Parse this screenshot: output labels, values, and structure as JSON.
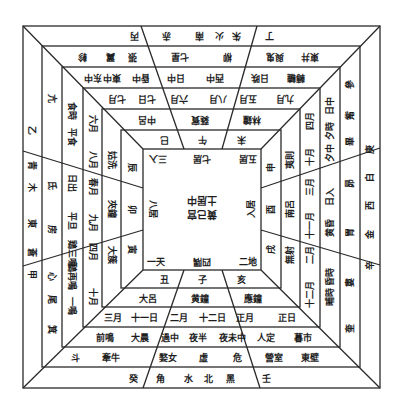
{
  "diagram": {
    "title": "",
    "center": {
      "line1": "土居中",
      "line2": "黄己宫"
    },
    "inner_corners": {
      "top_left": "三入",
      "top_mid": "七居",
      "top_right": "五居",
      "left_mid": "八居",
      "right_mid": "入居",
      "bottom_left": "一天",
      "bottom_mid": "四隅",
      "bottom_right": "二地"
    },
    "ring1": {
      "top": [
        "巳",
        "午",
        "未"
      ],
      "bottom": [
        "丑",
        "子",
        "亥"
      ],
      "left": [
        "辰",
        "卯",
        "寅"
      ],
      "right": [
        "申",
        "酉",
        "戌"
      ]
    },
    "ring2": {
      "top": [
        "中呂",
        "蕤賓",
        "林鐘"
      ],
      "bottom": [
        "大呂",
        "黄鐘",
        "應鐘"
      ],
      "left": [
        "姑洗",
        "夾鐘",
        "大簇"
      ],
      "right": [
        "夷則",
        "南呂",
        "無射"
      ]
    },
    "ring3": {
      "top": [
        "七月",
        "七日",
        "六月",
        "八月",
        "五月",
        "九月"
      ],
      "bottom": [
        "三月",
        "十一日",
        "二月",
        "十二日",
        "正月",
        "正日"
      ],
      "left": [
        "六月",
        "八月",
        "春月",
        "九月",
        "四月",
        "十月"
      ],
      "right": [
        "四月",
        "十月",
        "三月",
        "十一月",
        "二月",
        "十二月"
      ]
    },
    "ring4": {
      "top": [
        "东中",
        "東中",
        "昏中",
        "日中",
        "西中",
        "日昳",
        "轉轆"
      ],
      "bottom": [
        "前鳴",
        "大晨",
        "過中",
        "夜半",
        "夜未中",
        "人定",
        "暮市"
      ],
      "left": [
        "食時",
        "平食",
        "日出",
        "平旦",
        "鶏三鳴",
        "鶏再鳴",
        "一鳴"
      ],
      "right": [
        "日中",
        "夕時",
        "夕中",
        "日入",
        "黄昏",
        "昏時",
        "晡時"
      ]
    },
    "ring5": {
      "top": [
        "軫",
        "翼",
        "張",
        "七星",
        "柳",
        "與鬼",
        "東井"
      ],
      "bottom": [
        "斗",
        "牽牛",
        "婺女",
        "虛",
        "危",
        "營室",
        "東壁"
      ],
      "left": [
        "亢",
        "氐",
        "房",
        "心",
        "尾",
        "箕"
      ],
      "right": [
        "參",
        "觜",
        "畢",
        "昴",
        "胃",
        "婁",
        "奎"
      ]
    },
    "ring6": {
      "top": [
        "丙",
        "赤",
        "南",
        "火",
        "朱",
        "丁"
      ],
      "bottom": [
        "癸",
        "角",
        "水",
        "北",
        "黑",
        "壬"
      ],
      "left": [
        "乙",
        "青",
        "木",
        "東",
        "蒼",
        "甲"
      ],
      "right": [
        "庚",
        "白",
        "西",
        "金",
        "辛",
        "白"
      ]
    },
    "colors": {
      "line": "#2a2a2a",
      "text": "#1e1e1e",
      "background": "#ffffff"
    }
  }
}
